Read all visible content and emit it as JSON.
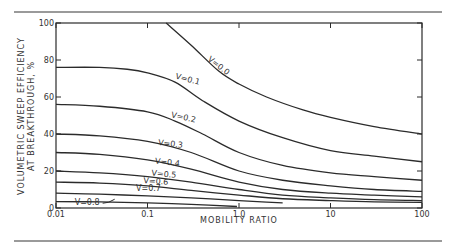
{
  "chart_data": {
    "type": "line",
    "title": "",
    "xlabel": "MOBILITY RATIO",
    "ylabel_line1": "VOLUMETRIC SWEEP EFFICIENCY",
    "ylabel_line2": "AT BREAKTHROUGH, %",
    "xscale": "log",
    "xlim": [
      0.01,
      100
    ],
    "ylim": [
      0,
      100
    ],
    "xticks": [
      0.01,
      0.1,
      1.0,
      10,
      100
    ],
    "xtick_labels": [
      "0.01",
      "0.1",
      "1.0",
      "10",
      "100"
    ],
    "yticks": [
      0,
      20,
      40,
      60,
      80,
      100
    ],
    "ytick_labels": [
      "0",
      "20",
      "40",
      "60",
      "80",
      "100"
    ],
    "grid": false,
    "legend": "inline curve labels",
    "series": [
      {
        "name": "V=0.0",
        "label": "V=0.0",
        "x": [
          0.16,
          0.3,
          0.6,
          1.0,
          2.0,
          5.0,
          10,
          30,
          100
        ],
        "y": [
          100,
          88,
          74,
          67,
          60,
          53,
          49,
          44,
          40
        ]
      },
      {
        "name": "V=0.1",
        "label": "V=0.1",
        "x": [
          0.01,
          0.03,
          0.06,
          0.1,
          0.2,
          0.4,
          1.0,
          3.0,
          10,
          30,
          100
        ],
        "y": [
          76,
          76,
          75,
          73,
          68,
          58,
          47,
          38,
          31,
          28,
          25
        ]
      },
      {
        "name": "V=0.2",
        "label": "V=0.2",
        "x": [
          0.01,
          0.03,
          0.1,
          0.2,
          0.4,
          1.0,
          3.0,
          10,
          30,
          100
        ],
        "y": [
          56,
          55,
          52,
          47,
          40,
          30,
          23,
          19,
          17,
          15
        ]
      },
      {
        "name": "V=0.3",
        "label": "V=0.3",
        "x": [
          0.01,
          0.03,
          0.1,
          0.3,
          1.0,
          3.0,
          10,
          30,
          100
        ],
        "y": [
          40,
          39,
          36,
          30,
          20,
          15,
          12,
          10,
          9
        ]
      },
      {
        "name": "V=0.4",
        "label": "V=0.4",
        "x": [
          0.01,
          0.03,
          0.1,
          0.3,
          1.0,
          3.0,
          10,
          30,
          100
        ],
        "y": [
          30,
          29,
          26,
          21,
          14,
          10,
          8,
          7,
          6
        ]
      },
      {
        "name": "V=0.5",
        "label": "V=0.5",
        "x": [
          0.01,
          0.03,
          0.1,
          0.3,
          1.0,
          3.0,
          10,
          30,
          100
        ],
        "y": [
          20,
          19,
          17,
          14,
          10,
          7,
          5.5,
          4.5,
          4
        ]
      },
      {
        "name": "V=0.6",
        "label": "V=0.6",
        "x": [
          0.01,
          0.03,
          0.1,
          0.3,
          1.0,
          3.0,
          10,
          30,
          100
        ],
        "y": [
          14,
          13.5,
          12,
          9.5,
          7,
          5,
          4,
          3.3,
          3
        ]
      },
      {
        "name": "V=0.7",
        "label": "V=0.7",
        "x": [
          0.01,
          0.03,
          0.1,
          0.3,
          1.0,
          2.0,
          3.0
        ],
        "y": [
          8,
          7.5,
          6.5,
          5.5,
          4,
          3.2,
          2.8
        ]
      },
      {
        "name": "V=0.8",
        "label": "V=0.8",
        "x": [
          0.01,
          0.03,
          0.1,
          0.3,
          0.95
        ],
        "y": [
          3.5,
          3.3,
          2.8,
          2,
          0.8
        ]
      }
    ],
    "annotations": [
      {
        "text": "V=0.0",
        "x": 0.45,
        "y": 80,
        "rotate": 38
      },
      {
        "text": "V=0.1",
        "x": 0.2,
        "y": 70,
        "rotate": 15
      },
      {
        "text": "V=0.2",
        "x": 0.18,
        "y": 49,
        "rotate": 12
      },
      {
        "text": "V=0.3",
        "x": 0.13,
        "y": 34,
        "rotate": 6
      },
      {
        "text": "V=0.4",
        "x": 0.12,
        "y": 24,
        "rotate": 6
      },
      {
        "text": "V=0.5",
        "x": 0.11,
        "y": 17.5,
        "rotate": 5
      },
      {
        "text": "V=0.6",
        "x": 0.09,
        "y": 13.5,
        "rotate": 4
      },
      {
        "text": "V=0.7",
        "x": 0.075,
        "y": 9,
        "rotate": 0
      },
      {
        "text": "V=0.8",
        "x": 0.016,
        "y": 1.5,
        "rotate": 0
      }
    ]
  },
  "colors": {
    "line": "#2b2b2b",
    "text": "#333333",
    "rule": "#9a9a9a",
    "background": "#ffffff"
  }
}
